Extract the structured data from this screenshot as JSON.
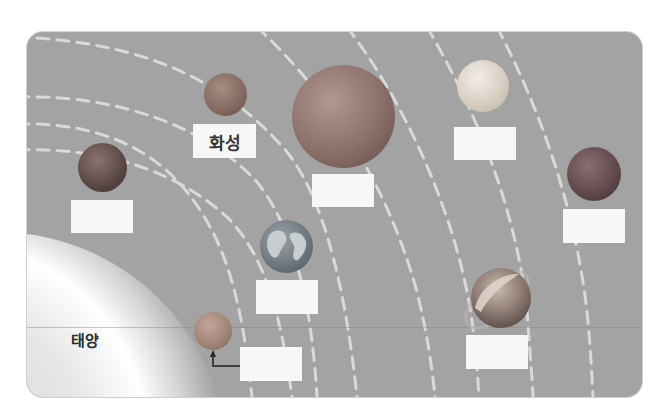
{
  "diagram": {
    "sun": {
      "label": "태양"
    },
    "labeled_planet": {
      "name": "화성"
    },
    "planets": [
      {
        "id": "mercury",
        "answer_label": "",
        "color": "#b98a6a"
      },
      {
        "id": "venus",
        "answer_label": "",
        "color": "#8d6b5c"
      },
      {
        "id": "earth",
        "answer_label": "",
        "color": "#5f6a72"
      },
      {
        "id": "mars",
        "answer_label": "화성",
        "color": "#8f6a5c"
      },
      {
        "id": "jupiter",
        "answer_label": "",
        "color": "#9c7a6c"
      },
      {
        "id": "saturn",
        "answer_label": "",
        "color": "#9a8470"
      },
      {
        "id": "uranus",
        "answer_label": "",
        "color": "#d3c9b8"
      },
      {
        "id": "neptune",
        "answer_label": "",
        "color": "#6a5458"
      }
    ],
    "colors": {
      "background": "#a3a3a3",
      "orbit": "#d9d9d9",
      "label_box": "#f7f7f7"
    }
  }
}
